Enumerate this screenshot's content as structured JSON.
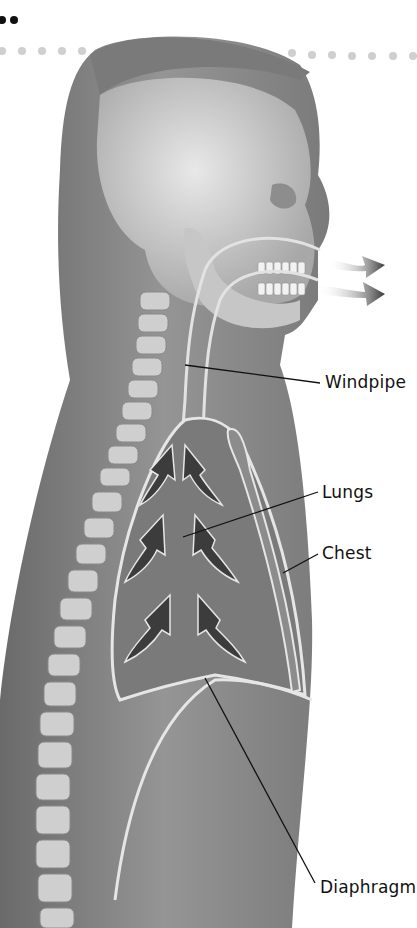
{
  "diagram": {
    "labels": [
      {
        "id": "windpipe",
        "text": "Windpipe",
        "x": 325,
        "y": 372,
        "target": [
          185,
          365
        ]
      },
      {
        "id": "lungs",
        "text": "Lungs",
        "x": 322,
        "y": 482,
        "target": [
          183,
          537
        ]
      },
      {
        "id": "chest",
        "text": "Chest",
        "x": 322,
        "y": 543,
        "target": [
          283,
          573
        ]
      },
      {
        "id": "diaphragm",
        "text": "Diaphragm",
        "x": 320,
        "y": 877,
        "target": [
          205,
          678
        ]
      }
    ],
    "airflow_arrows": {
      "direction": "out of mouth",
      "count": 2
    },
    "lung_arrows": {
      "direction": "upward",
      "count": 6
    },
    "colors": {
      "body": "#8a8a8a",
      "skin_dark": "#6e6e6e",
      "bone": "#d4d4d4",
      "lung": "#7c7c7c",
      "arrow": "#3c3c3c",
      "outline": "#e6e6e6",
      "dots_black": "#111111",
      "dots_gray": "#cfcfcf"
    }
  }
}
